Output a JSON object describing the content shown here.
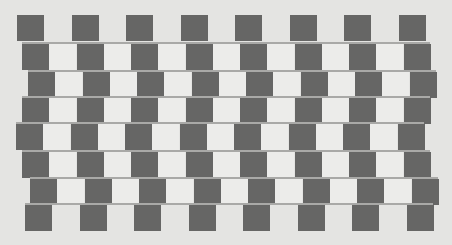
{
  "illusion": {
    "name": "Café wall illusion",
    "colors": {
      "background": "#e4e4e2",
      "dark_tile": "#666665",
      "light_tile": "#ececea",
      "mortar": "#a9a9a7"
    },
    "tile_width": 27,
    "tile_pitch": 54.5,
    "tiles_per_row": 8,
    "rows": [
      {
        "x": 17,
        "y": 15,
        "width": 409,
        "mortar_top": false,
        "light": false
      },
      {
        "x": 22,
        "y": 44,
        "width": 408,
        "mortar_top": true,
        "light": true
      },
      {
        "x": 28,
        "y": 72,
        "width": 408,
        "mortar_top": true,
        "light": true
      },
      {
        "x": 22,
        "y": 98,
        "width": 408,
        "mortar_top": true,
        "light": true
      },
      {
        "x": 16,
        "y": 124,
        "width": 408,
        "mortar_top": true,
        "light": true
      },
      {
        "x": 22,
        "y": 152,
        "width": 408,
        "mortar_top": true,
        "light": true
      },
      {
        "x": 30,
        "y": 179,
        "width": 408,
        "mortar_top": true,
        "light": true
      },
      {
        "x": 25,
        "y": 205,
        "width": 408,
        "mortar_top": true,
        "light": false
      }
    ]
  }
}
